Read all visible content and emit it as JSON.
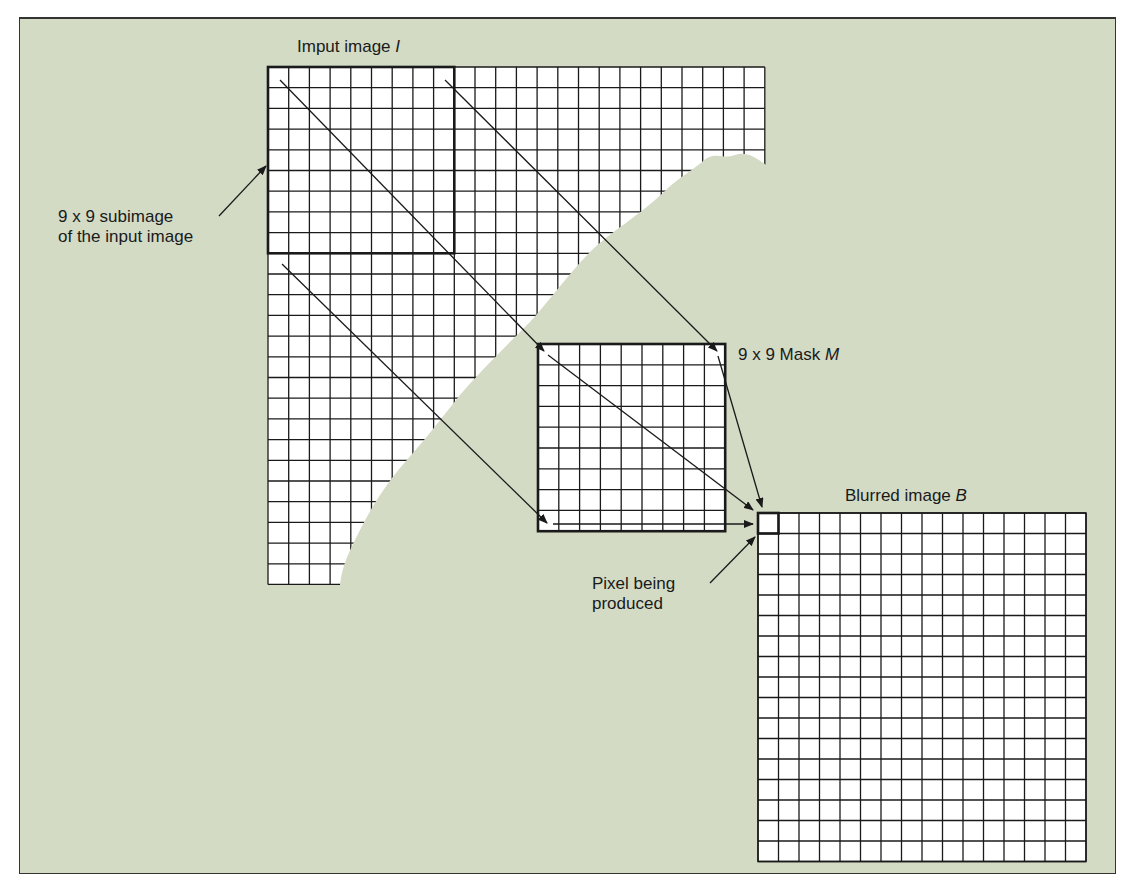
{
  "labels": {
    "input_image": "Imput image",
    "input_image_symbol": "I",
    "subimage_line1": "9 x 9 subimage",
    "subimage_line2": "of the input image",
    "mask": "9 x 9 Mask",
    "mask_symbol": "M",
    "blurred_image": "Blurred image",
    "blurred_image_symbol": "B",
    "pixel_line1": "Pixel being",
    "pixel_line2": "produced"
  },
  "colors": {
    "background": "#d3dbc5",
    "grid_fill": "#ffffff",
    "line": "#1a1a1a"
  },
  "diagram": {
    "input_grid": {
      "x": 268,
      "y": 67,
      "cell": 20.7,
      "cols": 24,
      "rows": 25
    },
    "subimage": {
      "x": 268,
      "y": 67,
      "size": 9
    },
    "mask": {
      "x": 538,
      "y": 344,
      "cell": 20.8,
      "size": 9
    },
    "blurred_grid": {
      "x": 758,
      "y": 513,
      "cell": 20.5,
      "cols": 16,
      "rows": 17
    },
    "output_pixel": {
      "x": 758,
      "y": 513
    }
  }
}
